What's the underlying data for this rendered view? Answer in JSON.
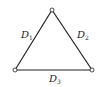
{
  "diagram": {
    "type": "triangle-graph",
    "vertices": [
      {
        "id": "top",
        "x": 52,
        "y": 10
      },
      {
        "id": "bottom-left",
        "x": 15,
        "y": 70
      },
      {
        "id": "bottom-right",
        "x": 92,
        "y": 70
      }
    ],
    "edges": [
      {
        "id": "D1",
        "label_main": "D",
        "label_sub": "1",
        "from": "bottom-left",
        "to": "top"
      },
      {
        "id": "D2",
        "label_main": "D",
        "label_sub": "2",
        "from": "top",
        "to": "bottom-right"
      },
      {
        "id": "D3",
        "label_main": "D",
        "label_sub": "3",
        "from": "bottom-left",
        "to": "bottom-right"
      }
    ],
    "colors": {
      "line": "#222222",
      "node_fill": "#ffffff"
    }
  }
}
